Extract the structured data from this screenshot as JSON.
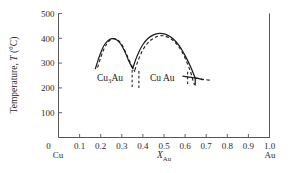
{
  "figure": {
    "background": "#ffffff",
    "line_color": "#1c1c1c",
    "axis_color": "#555555"
  },
  "axes": {
    "y_title": "Temperature, T (°C)",
    "y_title_prefix": "Temperature, ",
    "y_title_symbol": "T",
    "y_title_units": " (°C)",
    "x_title_symbol": "X",
    "x_title_subscript": "Au",
    "y_ticks": [
      "500",
      "400",
      "300",
      "200",
      "100"
    ],
    "y_tick_values": [
      500,
      400,
      300,
      200,
      100
    ],
    "x_ticks": [
      "0",
      "0.1",
      "0.2",
      "0.3",
      "0.4",
      "0.5",
      "0.6",
      "0.7",
      "0.8",
      "0.9",
      "1.0"
    ],
    "x_tick_values": [
      0,
      0.1,
      0.2,
      0.3,
      0.4,
      0.5,
      0.6,
      0.7,
      0.8,
      0.9,
      1.0
    ],
    "x_left_endpoint": "Cu",
    "x_right_endpoint": "Au",
    "xlim": [
      0,
      1.0
    ],
    "ylim": [
      0,
      500
    ]
  },
  "annotations": {
    "phase_left_main": "Cu",
    "phase_left_sub": "3",
    "phase_left_tail": "Au",
    "phase_left_full": "Cu3Au",
    "phase_right_full": "Cu Au"
  },
  "chart_data": {
    "type": "line",
    "title": "",
    "xlabel": "X_Au",
    "ylabel": "Temperature, T (°C)",
    "xlim": [
      0,
      1.0
    ],
    "ylim": [
      0,
      500
    ],
    "grid": false,
    "legend": "none",
    "series": [
      {
        "name": "Cu3Au dome (solid)",
        "style": "solid",
        "points": [
          [
            0.175,
            278
          ],
          [
            0.19,
            318
          ],
          [
            0.205,
            352
          ],
          [
            0.22,
            377
          ],
          [
            0.24,
            394
          ],
          [
            0.255,
            399
          ],
          [
            0.275,
            394
          ],
          [
            0.295,
            377
          ],
          [
            0.315,
            345
          ],
          [
            0.33,
            315
          ],
          [
            0.345,
            288
          ],
          [
            0.352,
            278
          ]
        ]
      },
      {
        "name": "Cu3Au dome (dashed)",
        "style": "dashed",
        "points": [
          [
            0.185,
            282
          ],
          [
            0.2,
            322
          ],
          [
            0.215,
            356
          ],
          [
            0.232,
            381
          ],
          [
            0.25,
            396
          ],
          [
            0.268,
            398
          ],
          [
            0.288,
            388
          ],
          [
            0.305,
            367
          ],
          [
            0.322,
            336
          ],
          [
            0.34,
            302
          ],
          [
            0.355,
            277
          ],
          [
            0.362,
            265
          ]
        ]
      },
      {
        "name": "CuAu dome (solid)",
        "style": "solid",
        "points": [
          [
            0.352,
            278
          ],
          [
            0.365,
            312
          ],
          [
            0.382,
            347
          ],
          [
            0.4,
            375
          ],
          [
            0.425,
            400
          ],
          [
            0.45,
            414
          ],
          [
            0.478,
            420
          ],
          [
            0.505,
            417
          ],
          [
            0.532,
            405
          ],
          [
            0.558,
            385
          ],
          [
            0.583,
            356
          ],
          [
            0.605,
            322
          ],
          [
            0.625,
            287
          ],
          [
            0.642,
            252
          ],
          [
            0.648,
            240
          ]
        ]
      },
      {
        "name": "CuAu dome (dashed)",
        "style": "dashed",
        "points": [
          [
            0.362,
            272
          ],
          [
            0.378,
            312
          ],
          [
            0.398,
            350
          ],
          [
            0.42,
            378
          ],
          [
            0.445,
            397
          ],
          [
            0.47,
            408
          ],
          [
            0.495,
            410
          ],
          [
            0.52,
            404
          ],
          [
            0.545,
            390
          ],
          [
            0.568,
            368
          ],
          [
            0.59,
            338
          ],
          [
            0.61,
            300
          ],
          [
            0.627,
            262
          ],
          [
            0.638,
            228
          ],
          [
            0.645,
            212
          ]
        ]
      },
      {
        "name": "Right invariant line (solid)",
        "style": "solid",
        "points": [
          [
            0.59,
            247
          ],
          [
            0.648,
            240
          ],
          [
            0.685,
            233
          ]
        ]
      },
      {
        "name": "Right tail (dashed)",
        "style": "dashed",
        "points": [
          [
            0.648,
            240
          ],
          [
            0.69,
            234
          ],
          [
            0.72,
            231
          ]
        ]
      },
      {
        "name": "Vertical tie line a",
        "style": "dashed-vertical",
        "points": [
          [
            0.349,
            272
          ],
          [
            0.349,
            200
          ]
        ]
      },
      {
        "name": "Vertical tie line b",
        "style": "dashed-vertical",
        "points": [
          [
            0.381,
            268
          ],
          [
            0.381,
            200
          ]
        ]
      },
      {
        "name": "Vertical tie line c",
        "style": "dashed-vertical",
        "points": [
          [
            0.612,
            265
          ],
          [
            0.612,
            208
          ]
        ]
      },
      {
        "name": "Right vertical drop (solid)",
        "style": "solid-vertical",
        "points": [
          [
            0.648,
            240
          ],
          [
            0.648,
            212
          ]
        ]
      }
    ],
    "annotations": [
      {
        "text": "Cu3Au",
        "x": 0.245,
        "y": 285
      },
      {
        "text": "Cu Au",
        "x": 0.45,
        "y": 285
      }
    ]
  }
}
